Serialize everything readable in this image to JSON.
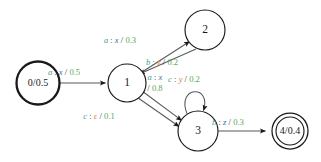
{
  "figure": {
    "kind": "weighted-finite-state-transducer",
    "background": "#ffffff",
    "colors": {
      "input_symbol": "#3f9f8f",
      "output_symbol_blue": "#3a6fb0",
      "output_symbol_orange": "#d88030",
      "weight": "#5aa84f",
      "punctuation": "#3a3a3a",
      "node_stroke": "#1a1a1a",
      "edge_stroke": "#555a5e"
    }
  },
  "states": [
    {
      "id": "s0",
      "name": "state-0-start",
      "label": "0/0.5",
      "number": "0",
      "weight": "0.5",
      "cx": 38,
      "cy": 83,
      "r": 21.5,
      "type": "start"
    },
    {
      "id": "s1",
      "name": "state-1",
      "label": "1",
      "number": "1",
      "weight": "",
      "cx": 127,
      "cy": 83,
      "r": 19,
      "type": "normal"
    },
    {
      "id": "s2",
      "name": "state-2",
      "label": "2",
      "number": "2",
      "weight": "",
      "cx": 205,
      "cy": 30,
      "r": 20,
      "type": "normal"
    },
    {
      "id": "s3",
      "name": "state-3",
      "label": "3",
      "number": "3",
      "weight": "",
      "cx": 198,
      "cy": 131,
      "r": 20,
      "type": "normal"
    },
    {
      "id": "s4",
      "name": "state-4-final",
      "label": "4/0.4",
      "number": "4",
      "weight": "0.4",
      "cx": 290,
      "cy": 131,
      "r": 18,
      "type": "final"
    }
  ],
  "transitions": [
    {
      "id": "t0",
      "name": "transition-0-to-1",
      "from": "0",
      "to": "1",
      "input": "a",
      "sep": ":",
      "output": "x",
      "slash": "/",
      "weight": "0.5",
      "output_color": "blue",
      "label_text": "a : x / 0.5",
      "label_x": 64,
      "label_y": 73,
      "lines": [
        {
          "x": 64,
          "y": 73,
          "parts": [
            "input",
            "sep",
            "output",
            "slash",
            "weight"
          ]
        }
      ]
    },
    {
      "id": "t1",
      "name": "transition-1-to-2",
      "from": "1",
      "to": "2",
      "input": "a",
      "sep": ":",
      "output": "x",
      "slash": "/",
      "weight": "0.3",
      "output_color": "blue",
      "label_text": "a : x / 0.3",
      "label_x": 120,
      "label_y": 41,
      "lines": [
        {
          "x": 120,
          "y": 41,
          "parts": [
            "input",
            "sep",
            "output",
            "slash",
            "weight"
          ]
        }
      ]
    },
    {
      "id": "t2",
      "name": "transition-2-to-1",
      "from": "2",
      "to": "1",
      "input": "b",
      "sep": ":",
      "output": "y",
      "slash": "/",
      "weight": "0.2",
      "output_color": "orange",
      "label_text": "b : y / 0.2",
      "label_x": 162,
      "label_y": 63,
      "lines": [
        {
          "x": 162,
          "y": 63,
          "parts": [
            "input",
            "sep",
            "output",
            "slash",
            "weight"
          ]
        }
      ]
    },
    {
      "id": "t3",
      "name": "transition-1-to-3-upper",
      "from": "1",
      "to": "3",
      "input": "a",
      "sep": ":",
      "output": "x",
      "slash": "/",
      "weight": "0.8",
      "output_color": "blue",
      "label_text": "a : x / 0.8",
      "label_x": 155,
      "label_y": 78,
      "lines": [
        {
          "x": 155,
          "y": 78,
          "parts": [
            "input",
            "sep",
            "output"
          ]
        },
        {
          "x": 155,
          "y": 89,
          "parts": [
            "slash",
            "weight"
          ]
        }
      ]
    },
    {
      "id": "t4",
      "name": "transition-1-to-3-lower",
      "from": "1",
      "to": "3",
      "input": "c",
      "sep": ":",
      "output": "ε",
      "slash": "/",
      "weight": "0.1",
      "output_color": "orange",
      "label_text": "c : ε / 0.1",
      "label_x": 99,
      "label_y": 117,
      "lines": [
        {
          "x": 99,
          "y": 117,
          "parts": [
            "input",
            "sep",
            "output",
            "slash",
            "weight"
          ]
        }
      ]
    },
    {
      "id": "t5",
      "name": "transition-3-self-loop",
      "from": "3",
      "to": "3",
      "input": "c",
      "sep": ":",
      "output": "y",
      "slash": "/",
      "weight": "0.2",
      "output_color": "orange",
      "label_text": "c : y / 0.2",
      "label_x": 184,
      "label_y": 80,
      "lines": [
        {
          "x": 184,
          "y": 80,
          "parts": [
            "input",
            "sep",
            "output",
            "slash",
            "weight"
          ]
        }
      ]
    },
    {
      "id": "t6",
      "name": "transition-3-to-4",
      "from": "3",
      "to": "4",
      "input": "b",
      "sep": ":",
      "output": "z",
      "slash": "/",
      "weight": "0.3",
      "output_color": "blue",
      "label_text": "b : z / 0.3",
      "label_x": 228,
      "label_y": 123,
      "lines": [
        {
          "x": 228,
          "y": 123,
          "parts": [
            "input",
            "sep",
            "output",
            "slash",
            "weight"
          ]
        }
      ]
    }
  ]
}
